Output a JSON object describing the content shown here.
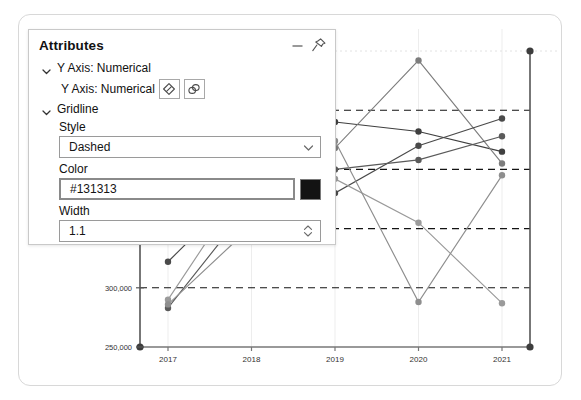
{
  "panel": {
    "title": "Attributes",
    "minimize_label": "—",
    "pin_label": "pin",
    "groups": [
      {
        "label": "Y Axis: Numerical"
      },
      {
        "label": "Gridline"
      }
    ],
    "subrow": {
      "label": "Y Axis: Numerical",
      "buttons": [
        {
          "name": "eraser-icon"
        },
        {
          "name": "link-icon"
        }
      ]
    },
    "fields": [
      {
        "label": "Style",
        "value": "Dashed",
        "type": "select"
      },
      {
        "label": "Color",
        "value": "#131313",
        "type": "color",
        "swatch": "#131313"
      },
      {
        "label": "Width",
        "value": "1.1",
        "type": "spinner"
      }
    ]
  },
  "chart_data": {
    "type": "line",
    "title": "",
    "xlabel": "",
    "ylabel": "",
    "grid": true,
    "gridline_style": "dashed",
    "gridline_color": "#131313",
    "gridline_width": 1.1,
    "legend": "none",
    "x": [
      "2017",
      "2018",
      "2019",
      "2020",
      "2021"
    ],
    "xticklabels": [
      "2017",
      "2018",
      "2019",
      "2020",
      "2021"
    ],
    "yticklabels": [
      "250,000",
      "300,000",
      "350,000",
      "400,000",
      "450,000"
    ],
    "ylim": [
      250000,
      500000
    ],
    "ytickvalues": [
      250000,
      300000,
      350000,
      400000,
      450000
    ],
    "series": [
      {
        "name": "series-1",
        "color": "#3f3f3f",
        "values": [
          365000,
          450000,
          440000,
          432000,
          415000
        ]
      },
      {
        "name": "series-2",
        "color": "#7d7d7d",
        "values": [
          345000,
          398000,
          418000,
          492000,
          405000
        ]
      },
      {
        "name": "series-3",
        "color": "#4a4a4a",
        "values": [
          322000,
          392000,
          380000,
          420000,
          443000
        ]
      },
      {
        "name": "series-4",
        "color": "#9a9a9a",
        "values": [
          290000,
          396000,
          392000,
          355000,
          287000
        ]
      },
      {
        "name": "series-5",
        "color": "#5a5a5a",
        "values": [
          283000,
          372000,
          400000,
          408000,
          428000
        ]
      },
      {
        "name": "series-6",
        "color": "#8e8e8e",
        "values": [
          286000,
          352000,
          424000,
          288000,
          395000
        ]
      }
    ]
  }
}
